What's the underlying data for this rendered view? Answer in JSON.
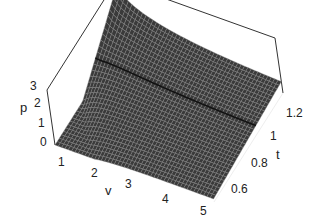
{
  "chart_data": {
    "type": "surface3d",
    "title": "",
    "function_description": "p(v,t) surface, van der Waals-like reduced pressure; p clipped to [0,3]",
    "axes": {
      "x": {
        "label": "v",
        "ticks": [
          "1",
          "2",
          "3",
          "4",
          "5"
        ],
        "range": [
          0.8,
          5
        ]
      },
      "y": {
        "label": "t",
        "ticks": [
          "0.6",
          "0.8",
          "1",
          "1.2"
        ],
        "range": [
          0.5,
          1.3
        ]
      },
      "z": {
        "label": "p",
        "ticks": [
          "0",
          "1",
          "2",
          "3"
        ],
        "range": [
          0,
          3
        ]
      }
    },
    "highlighted_curve": {
      "description": "critical isotherm t = 1, peak near v ~ 1.5"
    },
    "style": {
      "surface_color": "#3a3a3a",
      "mesh_color": "#9a9a9a",
      "box": true,
      "grid": "dense mesh"
    }
  },
  "labels": {
    "p": "p",
    "v": "v",
    "t": "t",
    "p_ticks": [
      "0",
      "1",
      "2",
      "3"
    ],
    "v_ticks": [
      "1",
      "2",
      "3",
      "4",
      "5"
    ],
    "t_ticks": [
      "0.6",
      "0.8",
      "1",
      "1.2"
    ]
  }
}
